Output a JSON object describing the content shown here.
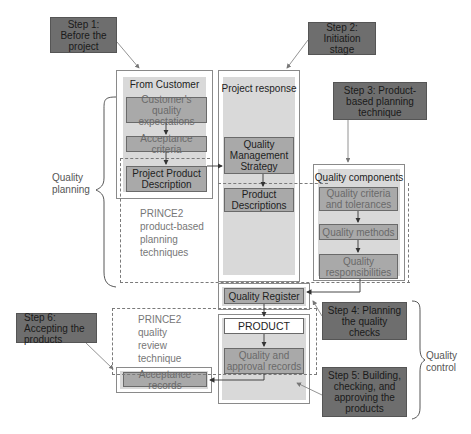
{
  "steps": {
    "step1": "Step 1: Before the project",
    "step2": "Step 2: Initiation stage",
    "step3": "Step 3: Product-based planning technique",
    "step4": "Step 4: Planning the quality checks",
    "step5": "Step 5: Building, checking, and approving the products",
    "step6": "Step 6: Accepting the products"
  },
  "panels": {
    "from_customer": {
      "title": "From Customer",
      "items": [
        "Customer's quality expectations",
        "Acceptance criteria",
        "Project Product Description"
      ]
    },
    "project_response": {
      "title": "Project response",
      "items": [
        "Quality Management Strategy",
        "Product Descriptions"
      ]
    },
    "quality_components": {
      "title": "Quality components",
      "items": [
        "Quality criteria and tolerances",
        "Quality methods",
        "Quality responsibilities"
      ]
    }
  },
  "control": {
    "quality_register": "Quality Register",
    "product": "PRODUCT",
    "records": "Quality and approval records",
    "acceptance_records": "Acceptance records"
  },
  "notes": {
    "planning_techniques": "PRINCE2 product-based planning techniques",
    "review_technique": "PRINCE2 quality review technique"
  },
  "braces": {
    "quality_planning": "Quality planning",
    "quality_control": "Quality control"
  },
  "colors": {
    "step_fill": "#6e6e6e",
    "panel_fill": "#d9d9d9",
    "box_fill": "#a9a9a9",
    "dashed_border": "#7a7a7a"
  }
}
